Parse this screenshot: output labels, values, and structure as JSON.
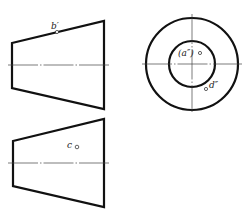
{
  "diagram": {
    "views": [
      {
        "id": "front-view",
        "shape": "trapezoid",
        "label": "b′",
        "label_point": "b′"
      },
      {
        "id": "side-view",
        "shape": "concentric-circles",
        "labels": [
          "(a″)",
          "d″"
        ]
      },
      {
        "id": "top-view",
        "shape": "trapezoid",
        "label": "c",
        "label_point": "c"
      }
    ],
    "labels": {
      "b_prime": "b′",
      "a_double_prime": "(a″)",
      "d_double_prime": "d″",
      "c": "c"
    },
    "colors": {
      "outline": "#111111",
      "centerline": "#444444",
      "background": "#ffffff"
    }
  }
}
